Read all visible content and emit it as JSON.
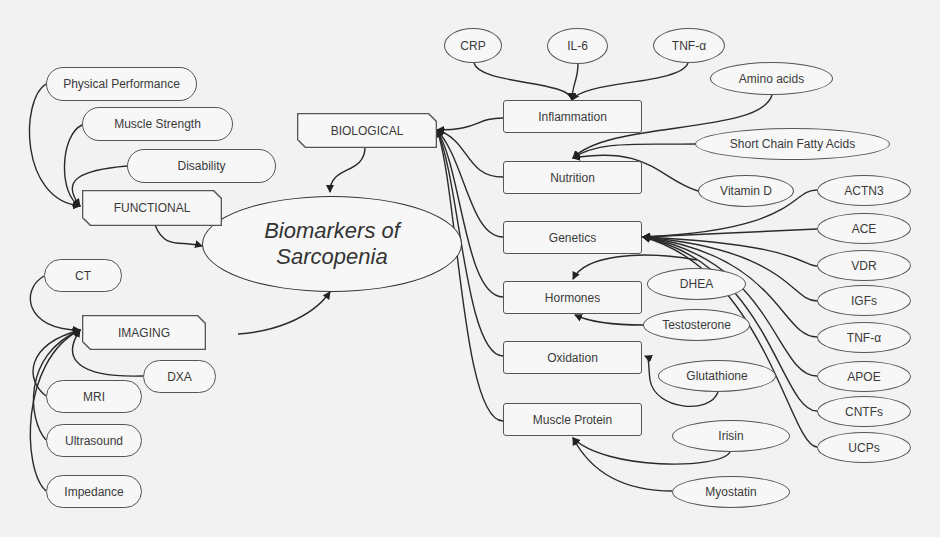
{
  "center": {
    "line1": "Biomarkers of",
    "line2": "Sarcopenia"
  },
  "categories": {
    "functional": "FUNCTIONAL",
    "imaging": "IMAGING",
    "biological": "BIOLOGICAL"
  },
  "functional_items": [
    "Physical Performance",
    "Muscle Strength",
    "Disability"
  ],
  "imaging_items": [
    "CT",
    "DXA",
    "MRI",
    "Ultrasound",
    "Impedance"
  ],
  "biological_groups": [
    "Inflammation",
    "Nutrition",
    "Genetics",
    "Hormones",
    "Oxidation",
    "Muscle Protein"
  ],
  "inflammation_items": [
    "CRP",
    "IL-6",
    "TNF-α"
  ],
  "nutrition_items": [
    "Amino acids",
    "Short Chain Fatty Acids",
    "Vitamin D"
  ],
  "genetics_items": [
    "ACTN3",
    "ACE",
    "VDR",
    "IGFs",
    "TNF-α",
    "APOE",
    "CNTFs",
    "UCPs"
  ],
  "hormones_items": [
    "DHEA",
    "Testosterone"
  ],
  "oxidation_items": [
    "Glutathione"
  ],
  "muscle_protein_items": [
    "Irisin",
    "Myostatin"
  ]
}
